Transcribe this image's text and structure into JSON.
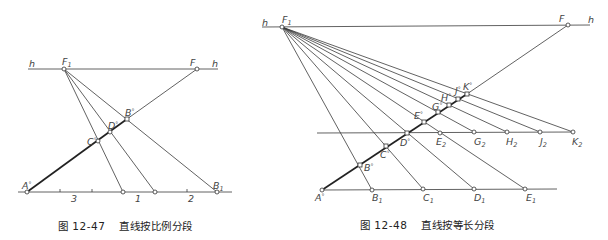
{
  "figure_left": {
    "number": "图 12-47",
    "title": "直线按比例分段",
    "labels": {
      "h_left": "h",
      "h_right": "h",
      "F1": "F",
      "F1_sub": "1",
      "F": "F",
      "A": "A",
      "B": "B",
      "C": "C",
      "D": "D",
      "B1": "B",
      "B1_sub": "1",
      "deg": "°"
    },
    "ratio_labels": [
      "3",
      "1",
      "2"
    ]
  },
  "figure_right": {
    "number": "图 12-48",
    "title": "直线按等长分段",
    "labels": {
      "h_left": "h",
      "h_right": "h",
      "F1": "F",
      "F1_sub": "1",
      "F": "F",
      "deg": "°",
      "A": "A",
      "B": "B",
      "C": "C",
      "D": "D",
      "E": "E",
      "G": "G",
      "H": "H",
      "J": "J",
      "K": "K",
      "B1": "B",
      "C1": "C",
      "D1": "D",
      "E1": "E",
      "E2": "E",
      "G2": "G",
      "H2": "H",
      "J2": "J",
      "K2": "K",
      "sub1": "1",
      "sub2": "2"
    }
  }
}
